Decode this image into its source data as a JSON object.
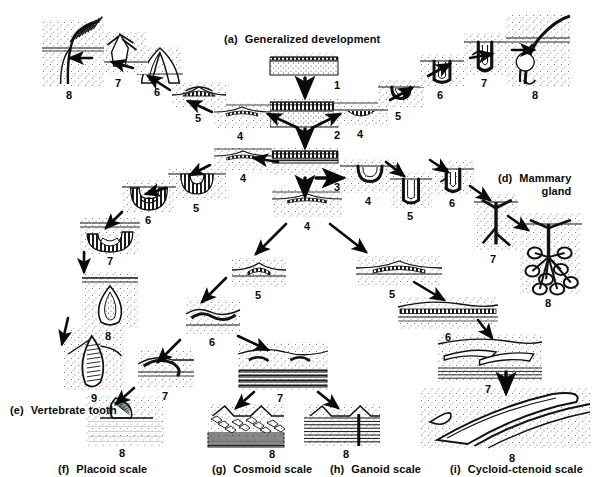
{
  "figure": {
    "background_color": "#ffffff",
    "ink_color": "#0a0a0a",
    "title_truncated_top_left": "(b)  Bird feather",
    "title_truncated_top_right": "(c)"
  },
  "panel_labels": [
    {
      "id": "a",
      "tag": "(a)",
      "text": "Generalized development",
      "x": 224,
      "y": 33
    },
    {
      "id": "d",
      "tag": "(d)",
      "text": "Mammary",
      "text2": "gland",
      "x": 498,
      "y": 172
    },
    {
      "id": "e",
      "tag": "(e)",
      "text": "Vertebrate tooth",
      "x": 10,
      "y": 404
    },
    {
      "id": "f",
      "tag": "(f)",
      "text": "Placoid scale",
      "x": 58,
      "y": 463
    },
    {
      "id": "g",
      "tag": "(g)",
      "text": "Cosmoid scale",
      "x": 212,
      "y": 463
    },
    {
      "id": "h",
      "tag": "(h)",
      "text": "Ganoid scale",
      "x": 330,
      "y": 463
    },
    {
      "id": "i",
      "tag": "(i)",
      "text": "Cycloid-ctenoid scale",
      "x": 450,
      "y": 463
    }
  ],
  "stage_numbers": {
    "central_column": [
      {
        "n": "1",
        "x": 337,
        "y": 79
      },
      {
        "n": "2",
        "x": 337,
        "y": 129
      },
      {
        "n": "3",
        "x": 337,
        "y": 181
      },
      {
        "n": "4",
        "x": 307,
        "y": 220
      }
    ],
    "feather_branch": [
      {
        "n": "4",
        "x": 240,
        "y": 130
      },
      {
        "n": "5",
        "x": 198,
        "y": 112
      },
      {
        "n": "6",
        "x": 157,
        "y": 86
      },
      {
        "n": "7",
        "x": 118,
        "y": 77
      },
      {
        "n": "8",
        "x": 69,
        "y": 89
      }
    ],
    "hair_branch": [
      {
        "n": "4",
        "x": 360,
        "y": 128
      },
      {
        "n": "5",
        "x": 398,
        "y": 110
      },
      {
        "n": "6",
        "x": 440,
        "y": 89
      },
      {
        "n": "7",
        "x": 484,
        "y": 77
      },
      {
        "n": "8",
        "x": 535,
        "y": 89
      }
    ],
    "tooth_branch": [
      {
        "n": "4",
        "x": 243,
        "y": 172
      },
      {
        "n": "5",
        "x": 196,
        "y": 202
      },
      {
        "n": "6",
        "x": 148,
        "y": 214
      },
      {
        "n": "7",
        "x": 110,
        "y": 255
      },
      {
        "n": "8",
        "x": 108,
        "y": 330
      },
      {
        "n": "9",
        "x": 94,
        "y": 392
      }
    ],
    "mammary_branch": [
      {
        "n": "4",
        "x": 368,
        "y": 195
      },
      {
        "n": "5",
        "x": 410,
        "y": 210
      },
      {
        "n": "6",
        "x": 452,
        "y": 197
      },
      {
        "n": "7",
        "x": 493,
        "y": 253
      },
      {
        "n": "8",
        "x": 548,
        "y": 297
      }
    ],
    "dermal_scale_branch": [
      {
        "n": "5",
        "x": 258,
        "y": 289
      },
      {
        "n": "6",
        "x": 212,
        "y": 336
      },
      {
        "n": "7",
        "x": 165,
        "y": 390
      },
      {
        "n": "8",
        "x": 122,
        "y": 447
      },
      {
        "n": "7b",
        "x": 280,
        "y": 392
      },
      {
        "n": "8b",
        "x": 272,
        "y": 448
      },
      {
        "n": "8c",
        "x": 346,
        "y": 448
      }
    ],
    "cycloid_branch": [
      {
        "n": "5",
        "x": 392,
        "y": 288
      },
      {
        "n": "6",
        "x": 448,
        "y": 331
      },
      {
        "n": "7",
        "x": 488,
        "y": 383
      },
      {
        "n": "8",
        "x": 512,
        "y": 452
      }
    ]
  },
  "specimens": [
    {
      "name": "stage-1-flat-epidermis",
      "x": 270,
      "y": 53,
      "w": 68,
      "h": 22
    },
    {
      "name": "stage-2-thickened-epidermis",
      "x": 270,
      "y": 99,
      "w": 68,
      "h": 28
    },
    {
      "name": "stage-3-dermal-papilla",
      "x": 270,
      "y": 148,
      "w": 68,
      "h": 28
    },
    {
      "name": "stage-4-central-placode",
      "x": 272,
      "y": 190,
      "w": 70,
      "h": 28
    },
    {
      "name": "feather-stage-4",
      "x": 214,
      "y": 103,
      "w": 56,
      "h": 25
    },
    {
      "name": "feather-stage-5",
      "x": 172,
      "y": 82,
      "w": 54,
      "h": 26
    },
    {
      "name": "feather-stage-6",
      "x": 137,
      "y": 47,
      "w": 46,
      "h": 36
    },
    {
      "name": "feather-stage-7",
      "x": 96,
      "y": 32,
      "w": 52,
      "h": 42
    },
    {
      "name": "feather-stage-8",
      "x": 42,
      "y": 20,
      "w": 62,
      "h": 66
    },
    {
      "name": "hair-stage-4",
      "x": 334,
      "y": 101,
      "w": 54,
      "h": 25
    },
    {
      "name": "hair-stage-5",
      "x": 378,
      "y": 80,
      "w": 46,
      "h": 28
    },
    {
      "name": "hair-stage-6",
      "x": 420,
      "y": 54,
      "w": 44,
      "h": 33
    },
    {
      "name": "hair-stage-7",
      "x": 464,
      "y": 33,
      "w": 42,
      "h": 42
    },
    {
      "name": "hair-stage-8",
      "x": 506,
      "y": 14,
      "w": 64,
      "h": 73
    },
    {
      "name": "tooth-stage-4",
      "x": 214,
      "y": 147,
      "w": 58,
      "h": 24
    },
    {
      "name": "tooth-stage-5",
      "x": 168,
      "y": 168,
      "w": 58,
      "h": 32
    },
    {
      "name": "tooth-stage-6",
      "x": 122,
      "y": 180,
      "w": 54,
      "h": 32
    },
    {
      "name": "tooth-stage-7",
      "x": 80,
      "y": 218,
      "w": 60,
      "h": 36
    },
    {
      "name": "tooth-stage-8",
      "x": 82,
      "y": 272,
      "w": 56,
      "h": 56
    },
    {
      "name": "tooth-stage-9",
      "x": 62,
      "y": 328,
      "w": 62,
      "h": 62
    },
    {
      "name": "mammary-stage-4",
      "x": 340,
      "y": 159,
      "w": 60,
      "h": 34
    },
    {
      "name": "mammary-stage-5",
      "x": 390,
      "y": 172,
      "w": 42,
      "h": 36
    },
    {
      "name": "mammary-stage-6",
      "x": 432,
      "y": 160,
      "w": 42,
      "h": 35
    },
    {
      "name": "mammary-stage-7",
      "x": 474,
      "y": 194,
      "w": 44,
      "h": 56
    },
    {
      "name": "mammary-stage-8",
      "x": 520,
      "y": 212,
      "w": 62,
      "h": 82
    },
    {
      "name": "dermal-stage-5",
      "x": 232,
      "y": 258,
      "w": 54,
      "h": 30
    },
    {
      "name": "dermal-stage-6",
      "x": 186,
      "y": 300,
      "w": 54,
      "h": 34
    },
    {
      "name": "dermal-stage-7-placoid",
      "x": 138,
      "y": 350,
      "w": 56,
      "h": 38
    },
    {
      "name": "placoid-stage-8",
      "x": 86,
      "y": 396,
      "w": 78,
      "h": 50
    },
    {
      "name": "dermal-stage-7-bony",
      "x": 238,
      "y": 342,
      "w": 90,
      "h": 48
    },
    {
      "name": "cosmoid-stage-8",
      "x": 208,
      "y": 404,
      "w": 76,
      "h": 42
    },
    {
      "name": "ganoid-stage-8",
      "x": 304,
      "y": 404,
      "w": 76,
      "h": 42
    },
    {
      "name": "cycloid-stage-5",
      "x": 356,
      "y": 256,
      "w": 86,
      "h": 30
    },
    {
      "name": "cycloid-stage-6",
      "x": 398,
      "y": 296,
      "w": 100,
      "h": 34
    },
    {
      "name": "cycloid-stage-7",
      "x": 438,
      "y": 334,
      "w": 104,
      "h": 48
    },
    {
      "name": "cycloid-stage-8",
      "x": 420,
      "y": 388,
      "w": 170,
      "h": 60
    }
  ],
  "arrows": [
    {
      "name": "arrow-central-1-2",
      "x1": 305,
      "y1": 78,
      "x2": 305,
      "y2": 96,
      "w": 5
    },
    {
      "name": "arrow-central-2-3",
      "x1": 305,
      "y1": 129,
      "x2": 305,
      "y2": 146,
      "w": 5
    },
    {
      "name": "arrow-central-3-4",
      "x1": 305,
      "y1": 178,
      "x2": 305,
      "y2": 195,
      "w": 5
    },
    {
      "name": "arrow-to-feather-4",
      "x1": 298,
      "y1": 128,
      "x2": 268,
      "y2": 114,
      "w": 4
    },
    {
      "name": "arrow-feather-4-5",
      "x1": 212,
      "y1": 112,
      "x2": 188,
      "y2": 101,
      "w": 4
    },
    {
      "name": "arrow-feather-5-6",
      "x1": 170,
      "y1": 90,
      "x2": 148,
      "y2": 76,
      "w": 4
    },
    {
      "name": "arrow-feather-6-7",
      "x1": 133,
      "y1": 68,
      "x2": 112,
      "y2": 62,
      "w": 4
    },
    {
      "name": "arrow-feather-7-8",
      "x1": 92,
      "y1": 58,
      "x2": 70,
      "y2": 58,
      "w": 4
    },
    {
      "name": "arrow-to-hair-4",
      "x1": 312,
      "y1": 128,
      "x2": 340,
      "y2": 114,
      "w": 4
    },
    {
      "name": "arrow-hair-4-5",
      "x1": 390,
      "y1": 100,
      "x2": 412,
      "y2": 88,
      "w": 4
    },
    {
      "name": "arrow-hair-5-6",
      "x1": 428,
      "y1": 76,
      "x2": 450,
      "y2": 64,
      "w": 4
    },
    {
      "name": "arrow-hair-6-7",
      "x1": 470,
      "y1": 58,
      "x2": 492,
      "y2": 54,
      "w": 4
    },
    {
      "name": "arrow-hair-7-8",
      "x1": 512,
      "y1": 50,
      "x2": 534,
      "y2": 50,
      "w": 4
    },
    {
      "name": "arrow-to-tooth-4",
      "x1": 278,
      "y1": 162,
      "x2": 254,
      "y2": 158,
      "w": 4
    },
    {
      "name": "arrow-tooth-4-5",
      "x1": 210,
      "y1": 165,
      "x2": 190,
      "y2": 175,
      "w": 4
    },
    {
      "name": "arrow-tooth-5-6",
      "x1": 166,
      "y1": 188,
      "x2": 146,
      "y2": 194,
      "w": 4
    },
    {
      "name": "arrow-tooth-6-7",
      "x1": 122,
      "y1": 212,
      "x2": 106,
      "y2": 228,
      "w": 4
    },
    {
      "name": "arrow-tooth-7-8",
      "x1": 84,
      "y1": 252,
      "x2": 84,
      "y2": 272,
      "w": 4
    },
    {
      "name": "arrow-tooth-8-9",
      "x1": 68,
      "y1": 318,
      "x2": 62,
      "y2": 344,
      "w": 4
    },
    {
      "name": "arrow-to-mammary-4",
      "x1": 316,
      "y1": 178,
      "x2": 342,
      "y2": 178,
      "w": 5
    },
    {
      "name": "arrow-mammary-4-5",
      "x1": 386,
      "y1": 162,
      "x2": 404,
      "y2": 176,
      "w": 4
    },
    {
      "name": "arrow-mammary-5-6",
      "x1": 430,
      "y1": 160,
      "x2": 448,
      "y2": 172,
      "w": 4
    },
    {
      "name": "arrow-mammary-6-7",
      "x1": 470,
      "y1": 186,
      "x2": 490,
      "y2": 200,
      "w": 4
    },
    {
      "name": "arrow-mammary-7-8",
      "x1": 508,
      "y1": 216,
      "x2": 528,
      "y2": 230,
      "w": 4
    },
    {
      "name": "arrow-to-dermal-5",
      "x1": 286,
      "y1": 224,
      "x2": 256,
      "y2": 254,
      "w": 4
    },
    {
      "name": "arrow-dermal-5-6",
      "x1": 226,
      "y1": 278,
      "x2": 202,
      "y2": 302,
      "w": 4
    },
    {
      "name": "arrow-dermal-6-7",
      "x1": 180,
      "y1": 340,
      "x2": 158,
      "y2": 362,
      "w": 4
    },
    {
      "name": "arrow-dermal-7-8",
      "x1": 134,
      "y1": 388,
      "x2": 116,
      "y2": 404,
      "w": 4
    },
    {
      "name": "arrow-dermal-6-7b",
      "x1": 238,
      "y1": 336,
      "x2": 268,
      "y2": 350,
      "w": 4
    },
    {
      "name": "arrow-bony-7-cosmoid",
      "x1": 254,
      "y1": 392,
      "x2": 236,
      "y2": 408,
      "w": 4
    },
    {
      "name": "arrow-bony-7-ganoid",
      "x1": 318,
      "y1": 392,
      "x2": 338,
      "y2": 408,
      "w": 4
    },
    {
      "name": "arrow-to-cycloid-5",
      "x1": 330,
      "y1": 224,
      "x2": 366,
      "y2": 252,
      "w": 4
    },
    {
      "name": "arrow-cycloid-5-6",
      "x1": 414,
      "y1": 282,
      "x2": 444,
      "y2": 300,
      "w": 4
    },
    {
      "name": "arrow-cycloid-6-7",
      "x1": 478,
      "y1": 320,
      "x2": 492,
      "y2": 338,
      "w": 4
    },
    {
      "name": "arrow-cycloid-7-8",
      "x1": 506,
      "y1": 372,
      "x2": 506,
      "y2": 392,
      "w": 5
    }
  ]
}
